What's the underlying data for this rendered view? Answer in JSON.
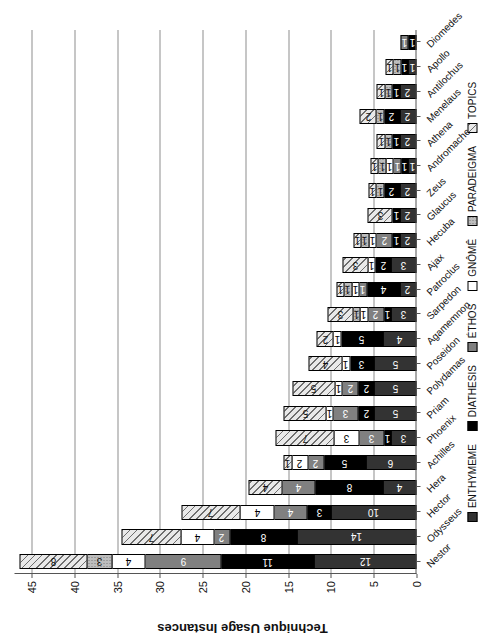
{
  "chart_data": {
    "type": "bar",
    "title": "",
    "xlabel": "",
    "ylabel": "Technique Usage Instances",
    "ylim": [
      0,
      47
    ],
    "yticks": [
      0,
      5,
      10,
      15,
      20,
      25,
      30,
      35,
      40,
      45
    ],
    "grid": true,
    "orientation": "vertical-stacked",
    "legend_position": "bottom",
    "categories": [
      "Nestor",
      "Odysseus",
      "Hector",
      "Hera",
      "Achilles",
      "Phoenix",
      "Priam",
      "Polydamas",
      "Poseidon",
      "Agamemnon",
      "Sarpedon",
      "Patroclus",
      "Ajax",
      "Hecuba",
      "Glaucus",
      "Zeus",
      "Andromache",
      "Athena",
      "Menelaus",
      "Antilochus",
      "Apollo",
      "Diomedes"
    ],
    "series": [
      {
        "name": "ENTHYMEME",
        "color": "#333333",
        "values": [
          12,
          14,
          10,
          4,
          6,
          3,
          5,
          5,
          5,
          4,
          3,
          2,
          3,
          2,
          2,
          2,
          1,
          2,
          2,
          2,
          1,
          0
        ]
      },
      {
        "name": "DIATHESIS",
        "color": "#000000",
        "values": [
          11,
          8,
          3,
          8,
          5,
          1,
          2,
          2,
          3,
          5,
          1,
          4,
          2,
          1,
          1,
          2,
          1,
          1,
          2,
          1,
          1,
          1
        ]
      },
      {
        "name": "ÉTHOS",
        "color": "#808080",
        "values": [
          9,
          2,
          4,
          4,
          2,
          3,
          3,
          2,
          0,
          0,
          2,
          1,
          0,
          2,
          0,
          0,
          1,
          0,
          0,
          0,
          0,
          1
        ]
      },
      {
        "name": "GNÔMÊ",
        "color": "#ffffff",
        "values": [
          4,
          4,
          4,
          0,
          2,
          3,
          1,
          1,
          1,
          1,
          1,
          1,
          1,
          1,
          0,
          0,
          1,
          0,
          0,
          0,
          0,
          0
        ]
      },
      {
        "name": "PARADEIGMA",
        "color": "#bdbdbd",
        "values": [
          3,
          0,
          0,
          0,
          0,
          0,
          0,
          0,
          0,
          0,
          1,
          1,
          0,
          1,
          0,
          1,
          1,
          1,
          1,
          1,
          1,
          0
        ]
      },
      {
        "name": "TOPICS",
        "color": "#e9e9e9",
        "values": [
          8,
          7,
          7,
          4,
          1,
          7,
          5,
          5,
          4,
          2,
          3,
          1,
          3,
          1,
          3,
          1,
          1,
          1,
          2,
          1,
          1,
          0
        ]
      }
    ]
  },
  "legend": {
    "items": [
      {
        "label": "ENTHYMEME",
        "swatch": "s-enthymeme"
      },
      {
        "label": "DIATHESIS",
        "swatch": "s-diathesis"
      },
      {
        "label": "ÉTHOS",
        "swatch": "s-ethos"
      },
      {
        "label": "GNÔMÊ",
        "swatch": "s-gnome"
      },
      {
        "label": "PARADEIGMA",
        "swatch": "s-paradeigma"
      },
      {
        "label": "TOPICS",
        "swatch": "s-topics"
      }
    ]
  }
}
